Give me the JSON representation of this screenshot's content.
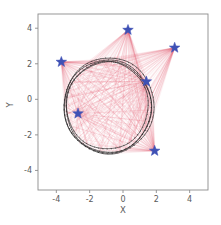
{
  "chart_data": {
    "type": "scatter",
    "title": "",
    "xlabel": "X",
    "ylabel": "Y",
    "xlim": [
      -5.1,
      5.1
    ],
    "ylim": [
      -5.1,
      4.8
    ],
    "xticks": [
      -4,
      -2,
      0,
      2,
      4
    ],
    "yticks": [
      -4,
      -2,
      0,
      2,
      4
    ],
    "xticklabels": [
      "-4",
      "-2",
      "0",
      "2",
      "4"
    ],
    "yticklabels": [
      "-4",
      "-2",
      "0",
      "2",
      "4"
    ],
    "grid": false,
    "legend": null,
    "background": "#ffffff",
    "series": [
      {
        "name": "anchors",
        "marker": "star",
        "color": "#3f51b5",
        "size": 9,
        "points": [
          {
            "x": 0.3,
            "y": 3.9
          },
          {
            "x": -3.7,
            "y": 2.1
          },
          {
            "x": 3.1,
            "y": 2.9
          },
          {
            "x": 1.4,
            "y": 1.0
          },
          {
            "x": -2.7,
            "y": -0.8
          },
          {
            "x": 1.9,
            "y": -2.9
          }
        ]
      },
      {
        "name": "trajectory",
        "marker": "line",
        "color": "#262626",
        "shape": "circle",
        "center": {
          "x": -0.9,
          "y": -0.4
        },
        "radius": 2.6,
        "loops": 4,
        "radius_jitter": [
          2.46,
          2.55,
          2.62,
          2.7
        ],
        "center_jitter": [
          {
            "x": -0.95,
            "y": -0.34
          },
          {
            "x": -0.86,
            "y": -0.44
          },
          {
            "x": -0.92,
            "y": -0.4
          },
          {
            "x": -0.84,
            "y": -0.36
          }
        ]
      },
      {
        "name": "measurement-rays",
        "marker": "line",
        "color": "#e8536a",
        "alpha": 0.18,
        "description": "bundles of range/bearing measurement lines from trajectory samples to each anchor"
      }
    ]
  },
  "axes": {
    "x_axis_label": "X",
    "y_axis_label": "Y"
  }
}
